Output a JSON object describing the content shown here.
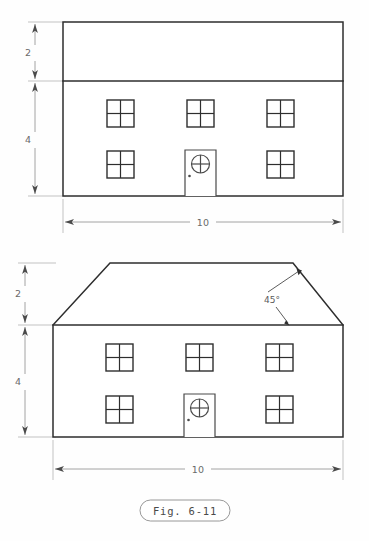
{
  "figure": {
    "caption": "Fig. 6-11",
    "caption_style": "pill-outline",
    "sheet_background": "#fefefe",
    "line_color": "#2e2e2e",
    "dimension_color": "#9a9a9a",
    "dimension_text_color": "#6a6a6a"
  },
  "views": [
    {
      "id": "top-view",
      "name": "front-elevation-flat-roof",
      "description": "Orthographic front view of a two-story house with a flat rectangular roof band",
      "outline": {
        "type": "rectangle",
        "x": 63,
        "y": 22,
        "width": 280,
        "height": 174
      },
      "roof_band_divider_y": 81,
      "dimensions": [
        {
          "name": "roof-height",
          "label": "2",
          "orientation": "vertical",
          "value": 2,
          "from_y": 22,
          "to_y": 81,
          "text_x": 28,
          "text_y": 56
        },
        {
          "name": "wall-height",
          "label": "4",
          "orientation": "vertical",
          "value": 4,
          "from_y": 81,
          "to_y": 196,
          "text_x": 28,
          "text_y": 143
        },
        {
          "name": "overall-width",
          "label": "10",
          "orientation": "horizontal",
          "value": 10,
          "from_x": 63,
          "to_x": 343,
          "text_x": 203,
          "text_y": 226
        }
      ],
      "windows": [
        {
          "name": "window-upper-left",
          "x": 107,
          "y": 100,
          "size": 27
        },
        {
          "name": "window-upper-mid",
          "x": 187,
          "y": 100,
          "size": 27
        },
        {
          "name": "window-upper-right",
          "x": 267,
          "y": 100,
          "size": 27
        },
        {
          "name": "window-lower-left",
          "x": 107,
          "y": 151,
          "size": 27
        },
        {
          "name": "window-lower-right",
          "x": 267,
          "y": 151,
          "size": 27
        }
      ],
      "door": {
        "name": "front-door",
        "x": 185,
        "y": 150,
        "width": 31,
        "height": 46,
        "porthole": {
          "cx": 200.5,
          "cy": 164,
          "r": 9
        },
        "knob": {
          "cx": 189.5,
          "cy": 176,
          "r": 1.3
        }
      }
    },
    {
      "id": "bottom-view",
      "name": "front-elevation-chamfered-roof",
      "description": "Orthographic front view of the same house with 45 degree chamfered roof corners",
      "wall": {
        "type": "rectangle",
        "x": 53,
        "y": 325,
        "width": 290,
        "height": 112
      },
      "roof": {
        "type": "trapezoid",
        "eave_y": 325,
        "ridge_y": 263,
        "left_eave_x": 53,
        "right_eave_x": 343,
        "left_ridge_x": 110,
        "right_ridge_x": 293,
        "chamfer_angle": 45
      },
      "dimensions": [
        {
          "name": "roof-height",
          "label": "2",
          "orientation": "vertical",
          "value": 2,
          "from_y": 263,
          "to_y": 325,
          "text_x": 18,
          "text_y": 297
        },
        {
          "name": "wall-height",
          "label": "4",
          "orientation": "vertical",
          "value": 4,
          "from_y": 325,
          "to_y": 437,
          "text_x": 18,
          "text_y": 385
        },
        {
          "name": "overall-width",
          "label": "10",
          "orientation": "horizontal",
          "value": 10,
          "from_x": 53,
          "to_x": 343,
          "text_x": 198,
          "text_y": 473
        }
      ],
      "angle_note": {
        "name": "chamfer-angle-note",
        "label": "45°",
        "text_x": 272,
        "text_y": 303
      },
      "windows": [
        {
          "name": "window-upper-left",
          "x": 106,
          "y": 344,
          "size": 27
        },
        {
          "name": "window-upper-mid",
          "x": 186,
          "y": 344,
          "size": 27
        },
        {
          "name": "window-upper-right",
          "x": 266,
          "y": 344,
          "size": 27
        },
        {
          "name": "window-lower-left",
          "x": 106,
          "y": 396,
          "size": 27
        },
        {
          "name": "window-lower-right",
          "x": 266,
          "y": 396,
          "size": 27
        }
      ],
      "door": {
        "name": "front-door",
        "x": 184,
        "y": 394,
        "width": 31,
        "height": 43,
        "porthole": {
          "cx": 199.5,
          "cy": 408,
          "r": 9
        },
        "knob": {
          "cx": 188.5,
          "cy": 420,
          "r": 1.3
        }
      }
    }
  ]
}
